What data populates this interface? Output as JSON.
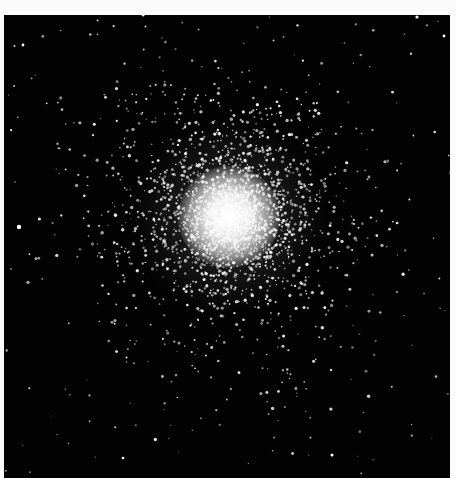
{
  "image": {
    "subject": "Globular star cluster",
    "description": "Black-and-white photograph of a dense globular star cluster with a bright white core surrounded by a halo of resolved stars on a black sky",
    "background_color": "#fbfbfb",
    "sky_color": "#020202",
    "star_color": "#f2f2f2",
    "frame": {
      "left": 4,
      "top": 15,
      "width": 446,
      "height": 463
    },
    "cluster": {
      "center_x": 229,
      "center_y": 217,
      "core_radius": 32,
      "halo_radius": 110,
      "halo_star_count": 2600,
      "field_star_count": 170
    },
    "bright_field_stars": [
      {
        "x": 19,
        "y": 227,
        "r": 2.2
      },
      {
        "x": 417,
        "y": 17,
        "r": 1.6
      },
      {
        "x": 23,
        "y": 45,
        "r": 1.4
      },
      {
        "x": 444,
        "y": 36,
        "r": 1.4
      },
      {
        "x": 332,
        "y": 455,
        "r": 1.5
      },
      {
        "x": 123,
        "y": 458,
        "r": 1.3
      }
    ]
  }
}
